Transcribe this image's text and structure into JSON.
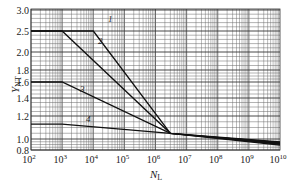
{
  "chart_data": {
    "type": "line",
    "title": "",
    "xlabel": "N_L",
    "ylabel": "Y_NT",
    "xscale": "log",
    "xlim": [
      100,
      10000000000
    ],
    "ylim": [
      0.8,
      3.0
    ],
    "grid": true,
    "legend": "curve numbers labeled inline (1-4)",
    "x_ticks": [
      "10^2",
      "10^3",
      "10^4",
      "10^5",
      "10^6",
      "10^7",
      "10^8",
      "10^9",
      "10^10"
    ],
    "y_ticks": [
      "0.8",
      "1.0",
      "1.2",
      "1.4",
      "1.6",
      "1.8",
      "2.0",
      "2.5",
      "3.0"
    ],
    "series": [
      {
        "name": "1",
        "points": [
          [
            100,
            2.5
          ],
          [
            10000,
            2.5
          ],
          [
            3000000,
            1.05
          ],
          [
            10000000000,
            0.95
          ]
        ]
      },
      {
        "name": "2",
        "points": [
          [
            100,
            2.5
          ],
          [
            1000,
            2.5
          ],
          [
            3000000,
            1.05
          ],
          [
            10000000000,
            0.93
          ]
        ]
      },
      {
        "name": "3",
        "points": [
          [
            100,
            1.6
          ],
          [
            1000,
            1.6
          ],
          [
            3000000,
            1.05
          ],
          [
            10000000000,
            0.91
          ]
        ]
      },
      {
        "name": "4",
        "points": [
          [
            100,
            1.13
          ],
          [
            1000,
            1.13
          ],
          [
            3000000,
            1.05
          ],
          [
            10000000000,
            0.89
          ]
        ]
      }
    ]
  },
  "axis": {
    "x_label_main": "N",
    "x_label_sub": "L",
    "y_label_main": "Y",
    "y_label_sub": "NT",
    "x_tick_base": "10",
    "x_tick_exps": [
      "2",
      "3",
      "4",
      "5",
      "6",
      "7",
      "8",
      "9",
      "10"
    ],
    "y_tick_labels": [
      "3.0",
      "2.5",
      "2.0",
      "1.8",
      "1.6",
      "1.4",
      "1.2",
      "1.0",
      "0.8"
    ]
  },
  "curve_labels": [
    "1",
    "2",
    "3",
    "4"
  ]
}
